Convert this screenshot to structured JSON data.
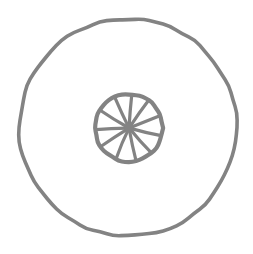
{
  "canvas": {
    "width": 253,
    "height": 254,
    "background_color": "#ffffff",
    "title": "Wheel Icon"
  },
  "artwork": {
    "name": "wheel-icon",
    "style": "hand-drawn line art",
    "stroke_color": "#838383",
    "outer_circle": {
      "label": "outer circle",
      "cx": 128,
      "cy": 127.5,
      "r": 109,
      "stroke_width": 3.6
    },
    "wheel": {
      "label": "spoked wheel",
      "cx": 129,
      "cy": 128,
      "rim_radius": 34,
      "rim_stroke_width": 4.2,
      "hub_radius": 4.5,
      "spoke_count": 11,
      "spoke_stroke_width": 3.2,
      "spoke_angles_deg": [
        -86,
        -53,
        -20,
        13,
        46,
        79,
        112,
        145,
        178,
        211,
        244
      ]
    }
  }
}
